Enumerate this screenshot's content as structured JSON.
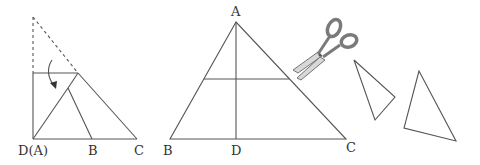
{
  "figure_left": {
    "labels": {
      "d_a": "D(A)",
      "b": "B",
      "c": "C"
    },
    "description": "Triangle with top folded down onto base point D"
  },
  "figure_middle": {
    "labels": {
      "a": "A",
      "b": "B",
      "d": "D",
      "c": "C"
    },
    "description": "Triangle ABC with altitude AD and midline"
  },
  "scissors": {
    "icon": "scissors-icon"
  },
  "pieces": {
    "count": 2
  },
  "colors": {
    "stroke": "#555555",
    "text": "#333333",
    "scissor_handle": "#7a7a7a",
    "scissor_blade": "#d8d8d8"
  }
}
